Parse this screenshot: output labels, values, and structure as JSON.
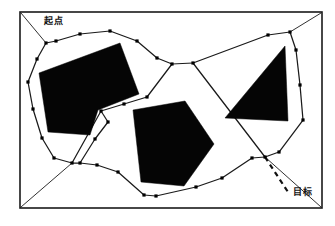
{
  "figure": {
    "title": "",
    "labels": {
      "start": "起点",
      "goal": "目标"
    },
    "colors": {
      "obstacle_fill": "#050505",
      "edge_stroke": "#1a1a1a",
      "node_fill": "#000000",
      "frame_stroke": "#1a1a1a",
      "background": "#ffffff",
      "leader_line": "#111111"
    }
  },
  "chart_data": {
    "type": "diagram",
    "subtype": "path-planning-roadmap",
    "title": "",
    "xlabel": "",
    "ylabel": "",
    "xlim": [
      0,
      335
    ],
    "ylim": [
      0,
      226
    ],
    "grid": false,
    "legend": "none",
    "annotations": [
      {
        "name": "start-label",
        "text": "起点",
        "x": 44,
        "y": 17
      },
      {
        "name": "goal-label",
        "text": "目标",
        "x": 293,
        "y": 188
      }
    ],
    "frame": {
      "name": "outer-frame",
      "x": 20,
      "y": 12,
      "width": 302,
      "height": 196,
      "stroke_width": 1.6
    },
    "obstacles": [
      {
        "name": "obstacle-l-shape-left",
        "shape": "L-polygon",
        "points": [
          [
            39,
            73
          ],
          [
            120,
            43
          ],
          [
            139,
            94
          ],
          [
            98,
            110
          ],
          [
            90,
            135
          ],
          [
            48,
            132
          ]
        ]
      },
      {
        "name": "obstacle-pentagon-center",
        "shape": "pentagon",
        "points": [
          [
            133,
            110
          ],
          [
            185,
            101
          ],
          [
            214,
            144
          ],
          [
            184,
            186
          ],
          [
            141,
            182
          ]
        ]
      },
      {
        "name": "obstacle-triangle-right",
        "shape": "triangle",
        "points": [
          [
            225,
            118
          ],
          [
            285,
            46
          ],
          [
            288,
            121
          ]
        ]
      }
    ],
    "corner_links": [
      {
        "name": "corner-link-top-left",
        "from": [
          21,
          13
        ],
        "to": [
          46,
          43
        ]
      },
      {
        "name": "corner-link-top-right",
        "from": [
          321,
          13
        ],
        "to": [
          290,
          32
        ]
      },
      {
        "name": "corner-link-bottom-left",
        "from": [
          21,
          207
        ],
        "to": [
          72,
          163
        ]
      },
      {
        "name": "corner-link-bottom-right",
        "from": [
          321,
          207
        ],
        "to": [
          265,
          157
        ]
      }
    ],
    "leader_line": {
      "name": "goal-leader-dashed",
      "from": [
        265,
        157
      ],
      "to": [
        288,
        192
      ],
      "dashed": true
    },
    "nodes": [
      {
        "id": 1,
        "x": 46,
        "y": 43
      },
      {
        "id": 2,
        "x": 56,
        "y": 41
      },
      {
        "id": 3,
        "x": 80,
        "y": 34
      },
      {
        "id": 4,
        "x": 110,
        "y": 31
      },
      {
        "id": 5,
        "x": 137,
        "y": 41
      },
      {
        "id": 6,
        "x": 157,
        "y": 58
      },
      {
        "id": 7,
        "x": 172,
        "y": 64
      },
      {
        "id": 8,
        "x": 193,
        "y": 63
      },
      {
        "id": 9,
        "x": 37,
        "y": 59
      },
      {
        "id": 10,
        "x": 28,
        "y": 82
      },
      {
        "id": 11,
        "x": 33,
        "y": 109
      },
      {
        "id": 12,
        "x": 42,
        "y": 138
      },
      {
        "id": 13,
        "x": 54,
        "y": 158
      },
      {
        "id": 14,
        "x": 72,
        "y": 163
      },
      {
        "id": 15,
        "x": 80,
        "y": 163
      },
      {
        "id": 16,
        "x": 97,
        "y": 165
      },
      {
        "id": 17,
        "x": 118,
        "y": 172
      },
      {
        "id": 18,
        "x": 144,
        "y": 195
      },
      {
        "id": 19,
        "x": 156,
        "y": 196
      },
      {
        "id": 20,
        "x": 196,
        "y": 187
      },
      {
        "id": 21,
        "x": 222,
        "y": 178
      },
      {
        "id": 22,
        "x": 252,
        "y": 158
      },
      {
        "id": 23,
        "x": 265,
        "y": 157
      },
      {
        "id": 24,
        "x": 101,
        "y": 111
      },
      {
        "id": 25,
        "x": 124,
        "y": 104
      },
      {
        "id": 26,
        "x": 147,
        "y": 97
      },
      {
        "id": 27,
        "x": 108,
        "y": 122
      },
      {
        "id": 28,
        "x": 95,
        "y": 139
      },
      {
        "id": 29,
        "x": 268,
        "y": 35
      },
      {
        "id": 30,
        "x": 290,
        "y": 32
      },
      {
        "id": 31,
        "x": 296,
        "y": 50
      },
      {
        "id": 32,
        "x": 300,
        "y": 85
      },
      {
        "id": 33,
        "x": 303,
        "y": 120
      },
      {
        "id": 34,
        "x": 279,
        "y": 152
      }
    ],
    "edges": [
      {
        "from": 1,
        "to": 2
      },
      {
        "from": 2,
        "to": 3
      },
      {
        "from": 3,
        "to": 4
      },
      {
        "from": 4,
        "to": 5
      },
      {
        "from": 5,
        "to": 6
      },
      {
        "from": 6,
        "to": 7
      },
      {
        "from": 7,
        "to": 8
      },
      {
        "from": 8,
        "to": 29
      },
      {
        "from": 29,
        "to": 30
      },
      {
        "from": 30,
        "to": 31
      },
      {
        "from": 31,
        "to": 32
      },
      {
        "from": 32,
        "to": 33
      },
      {
        "from": 33,
        "to": 34
      },
      {
        "from": 34,
        "to": 23
      },
      {
        "from": 1,
        "to": 9
      },
      {
        "from": 9,
        "to": 10
      },
      {
        "from": 10,
        "to": 11
      },
      {
        "from": 11,
        "to": 12
      },
      {
        "from": 12,
        "to": 13
      },
      {
        "from": 13,
        "to": 14
      },
      {
        "from": 14,
        "to": 15
      },
      {
        "from": 15,
        "to": 16
      },
      {
        "from": 16,
        "to": 17
      },
      {
        "from": 17,
        "to": 18
      },
      {
        "from": 18,
        "to": 19
      },
      {
        "from": 19,
        "to": 20
      },
      {
        "from": 20,
        "to": 21
      },
      {
        "from": 21,
        "to": 22
      },
      {
        "from": 22,
        "to": 23
      },
      {
        "from": 7,
        "to": 26
      },
      {
        "from": 26,
        "to": 25
      },
      {
        "from": 25,
        "to": 24
      },
      {
        "from": 24,
        "to": 27
      },
      {
        "from": 27,
        "to": 28
      },
      {
        "from": 28,
        "to": 15
      },
      {
        "from": 24,
        "to": 14
      },
      {
        "from": 8,
        "to": 23
      }
    ]
  }
}
